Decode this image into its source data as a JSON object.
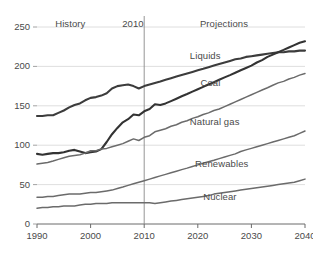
{
  "chart_data": {
    "type": "line",
    "title": "",
    "subtitle": "",
    "xlabel": "",
    "ylabel": "",
    "xlim": [
      1990,
      2040
    ],
    "ylim": [
      0,
      250
    ],
    "xticks": [
      "1990",
      "2000",
      "2010",
      "2020",
      "2030",
      "2040"
    ],
    "yticks": [
      "0",
      "50",
      "100",
      "150",
      "200",
      "250"
    ],
    "grid": "horizontal",
    "legend_position": "inline-labels",
    "annotations": [
      {
        "name": "history-label",
        "text": "History",
        "x": 1997.5,
        "y": 252
      },
      {
        "name": "projections-label",
        "text": "Projections",
        "x": 2024.5,
        "y": 252
      },
      {
        "name": "divider-year-label",
        "text": "2010",
        "x": 2010,
        "y": 252
      }
    ],
    "divider": {
      "x": 2010,
      "label": "2010"
    },
    "x": [
      1990,
      1991,
      1992,
      1993,
      1994,
      1995,
      1996,
      1997,
      1998,
      1999,
      2000,
      2001,
      2002,
      2003,
      2004,
      2005,
      2006,
      2007,
      2008,
      2009,
      2010,
      2011,
      2012,
      2013,
      2014,
      2015,
      2016,
      2017,
      2018,
      2019,
      2020,
      2021,
      2022,
      2023,
      2024,
      2025,
      2026,
      2027,
      2028,
      2029,
      2030,
      2031,
      2032,
      2033,
      2034,
      2035,
      2036,
      2037,
      2038,
      2039,
      2040
    ],
    "series": [
      {
        "name": "Liquids",
        "label": "Liquids",
        "color": "#3c3c3c",
        "width": 2.1,
        "label_x": 2018.5,
        "label_y": 212,
        "values": [
          137,
          137,
          138,
          138,
          141,
          144,
          148,
          151,
          153,
          157,
          160,
          161,
          163,
          166,
          172,
          175,
          176,
          177,
          175,
          172,
          175,
          177,
          179,
          181,
          183,
          185,
          187,
          189,
          191,
          193,
          195,
          197,
          199,
          201,
          203,
          205,
          207,
          209,
          210,
          212,
          213,
          214,
          215,
          216,
          217,
          218,
          218,
          219,
          219,
          220,
          220
        ]
      },
      {
        "name": "Coal",
        "label": "Coal",
        "color": "#333333",
        "width": 2.1,
        "label_x": 2020.5,
        "label_y": 178,
        "values": [
          89,
          88,
          89,
          90,
          90,
          91,
          93,
          94,
          92,
          90,
          91,
          92,
          95,
          104,
          114,
          122,
          129,
          133,
          139,
          138,
          143,
          146,
          152,
          151,
          153,
          156,
          159,
          162,
          165,
          168,
          171,
          174,
          177,
          180,
          183,
          186,
          189,
          192,
          195,
          198,
          201,
          205,
          208,
          212,
          215,
          218,
          221,
          224,
          227,
          230,
          232
        ]
      },
      {
        "name": "Natural gas",
        "label": "Natural gas",
        "color": "#6b6b6b",
        "width": 1.5,
        "label_x": 2018.5,
        "label_y": 128,
        "values": [
          76,
          77,
          78,
          80,
          82,
          84,
          86,
          87,
          88,
          90,
          93,
          93,
          95,
          96,
          98,
          100,
          102,
          105,
          108,
          106,
          110,
          112,
          117,
          119,
          121,
          124,
          126,
          129,
          131,
          134,
          136,
          139,
          141,
          144,
          146,
          149,
          152,
          155,
          158,
          161,
          164,
          167,
          170,
          173,
          176,
          179,
          181,
          184,
          186,
          189,
          191
        ]
      },
      {
        "name": "Renewables",
        "label": "Renewables",
        "color": "#6b6b6b",
        "width": 1.5,
        "label_x": 2019.5,
        "label_y": 75,
        "values": [
          34,
          34,
          35,
          35,
          36,
          37,
          38,
          38,
          38,
          39,
          40,
          40,
          41,
          42,
          43,
          45,
          47,
          49,
          51,
          53,
          55,
          57,
          59,
          61,
          63,
          65,
          67,
          69,
          71,
          73,
          75,
          77,
          79,
          81,
          83,
          85,
          87,
          89,
          92,
          94,
          96,
          98,
          100,
          102,
          104,
          106,
          108,
          110,
          112,
          115,
          118
        ]
      },
      {
        "name": "Nuclear",
        "label": "Nuclear",
        "color": "#6b6b6b",
        "width": 1.5,
        "label_x": 2021.0,
        "label_y": 33,
        "values": [
          20,
          21,
          21,
          22,
          22,
          23,
          23,
          23,
          24,
          25,
          25,
          26,
          26,
          26,
          27,
          27,
          27,
          27,
          27,
          27,
          27,
          27,
          26,
          27,
          28,
          29,
          30,
          31,
          32,
          33,
          34,
          35,
          36,
          38,
          39,
          40,
          41,
          42,
          43,
          44,
          45,
          46,
          47,
          48,
          49,
          50,
          51,
          52,
          53,
          55,
          57
        ]
      }
    ]
  }
}
